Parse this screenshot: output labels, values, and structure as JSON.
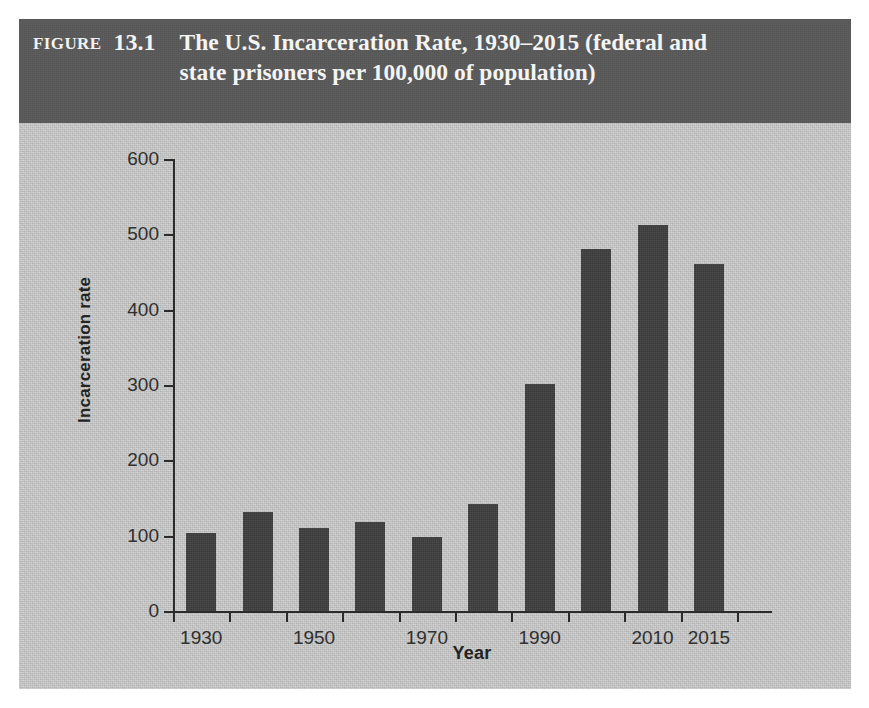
{
  "figure": {
    "label_word": "Figure",
    "number": "13.1",
    "title": "The U.S. Incarceration Rate, 1930–2015 (federal and state prisoners per 100,000 of population)",
    "header_bg": "#595959",
    "panel_bg": "#cbcbcb",
    "bar_color": "#3f3f3f",
    "axis_color": "#2b2b2b"
  },
  "chart_data": {
    "type": "bar",
    "title": "The U.S. Incarceration Rate, 1930–2015 (federal and state prisoners per 100,000 of population)",
    "xlabel": "Year",
    "ylabel": "Incarceration rate",
    "ylim": [
      0,
      600
    ],
    "yticks": [
      0,
      100,
      200,
      300,
      400,
      500,
      600
    ],
    "ytick_labels": [
      "0",
      "100",
      "200",
      "300",
      "400",
      "500",
      "600"
    ],
    "grid": false,
    "legend": false,
    "categories": [
      "1930",
      "1940",
      "1950",
      "1960",
      "1970",
      "1980",
      "1990",
      "2000",
      "2010",
      "2015"
    ],
    "xtick_labels": [
      "1930",
      "",
      "1950",
      "",
      "1970",
      "",
      "1990",
      "",
      "2010",
      "2015"
    ],
    "values": [
      103,
      131,
      110,
      118,
      98,
      142,
      301,
      480,
      513,
      461
    ]
  }
}
